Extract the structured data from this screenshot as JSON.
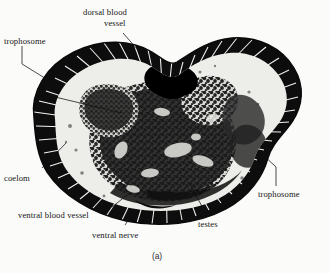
{
  "figure": {
    "caption": "(a)",
    "specimen_description": "Histological cross-section micrograph of a vestimentiferan tubeworm trunk",
    "background_color": "#fbfbfa",
    "ink_color": "#151515"
  },
  "labels": [
    {
      "id": "dorsal-blood-vessel",
      "line1": "dorsal blood",
      "line2": "vessel",
      "anchor": "top-center"
    },
    {
      "id": "trophosome-upper-left",
      "line1": "trophosome",
      "line2": "",
      "anchor": "top-left"
    },
    {
      "id": "coelom",
      "line1": "coelom",
      "line2": "",
      "anchor": "mid-left"
    },
    {
      "id": "ventral-blood-vessel",
      "line1": "ventral blood vessel",
      "line2": "",
      "anchor": "bottom-left"
    },
    {
      "id": "ventral-nerve",
      "line1": "ventral nerve",
      "line2": "",
      "anchor": "bottom-center"
    },
    {
      "id": "testes",
      "line1": "testes",
      "line2": "",
      "anchor": "bottom-right"
    },
    {
      "id": "trophosome-right",
      "line1": "trophosome",
      "line2": "",
      "anchor": "mid-right"
    }
  ]
}
